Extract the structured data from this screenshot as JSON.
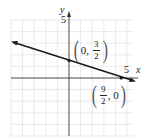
{
  "graph": {
    "x_axis_label": "x",
    "y_axis_label": "y",
    "x_tick_label": "5",
    "y_tick_label": "5",
    "line": {
      "equation_points": [
        [
          0,
          1.5
        ],
        [
          4.5,
          0
        ]
      ],
      "color": "#1a1a1a"
    },
    "points": [
      {
        "id": "y-intercept",
        "x_text": "0",
        "y_num": "3",
        "y_den": "2",
        "x": 0,
        "y": 1.5
      },
      {
        "id": "x-intercept",
        "x_num": "9",
        "x_den": "2",
        "y_text": "0",
        "x": 4.5,
        "y": 0
      }
    ],
    "grid_color": "#d8d8d8",
    "axis_color": "#333333"
  }
}
